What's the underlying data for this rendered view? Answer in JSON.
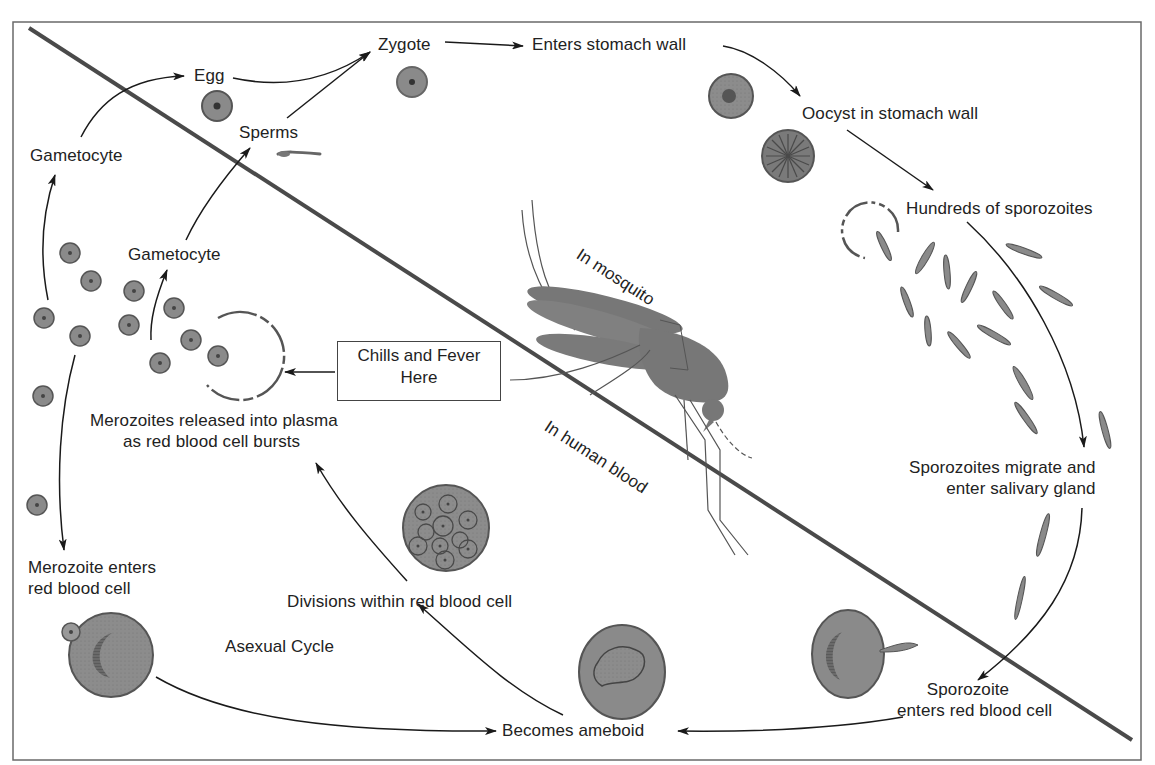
{
  "diagram": {
    "type": "life-cycle",
    "regions": {
      "upper_right": "In mosquito",
      "lower_left": "In human blood"
    },
    "colors": {
      "frame": "#6a6a6a",
      "divider": "#4a4a4a",
      "arrow": "#1a1a1a",
      "cell_fill": "#8a8a8a",
      "cell_stroke": "#555555",
      "nucleus": "#444444",
      "mosquito": "#7a7a7a"
    }
  },
  "labels": {
    "egg": "Egg",
    "zygote": "Zygote",
    "enters_stomach_wall": "Enters stomach wall",
    "oocyst": "Oocyst in stomach wall",
    "hundreds_sporozoites": "Hundreds of sporozoites",
    "sporozoites_migrate_1": "Sporozoites migrate and",
    "sporozoites_migrate_2": "enter salivary gland",
    "sporozoite_enters_1": "Sporozoite",
    "sporozoite_enters_2": "enters red blood cell",
    "becomes_ameboid": "Becomes ameboid",
    "divisions": "Divisions within red blood cell",
    "merozoites_released_1": "Merozoites released into plasma",
    "merozoites_released_2": "as red blood cell bursts",
    "merozoite_enters_1": "Merozoite enters",
    "merozoite_enters_2": "red blood cell",
    "asexual_cycle": "Asexual Cycle",
    "gametocyte_outer": "Gametocyte",
    "gametocyte_inner": "Gametocyte",
    "sperms": "Sperms",
    "in_mosquito": "In mosquito",
    "in_human_blood": "In human blood"
  },
  "callout": {
    "line1": "Chills and Fever",
    "line2": "Here"
  },
  "flow": [
    {
      "from": "Gametocyte",
      "to": "Egg"
    },
    {
      "from": "Gametocyte",
      "to": "Sperms"
    },
    {
      "from": "Egg",
      "to": "Zygote"
    },
    {
      "from": "Sperms",
      "to": "Zygote"
    },
    {
      "from": "Zygote",
      "to": "Enters stomach wall"
    },
    {
      "from": "Enters stomach wall",
      "to": "Oocyst in stomach wall"
    },
    {
      "from": "Oocyst in stomach wall",
      "to": "Hundreds of sporozoites"
    },
    {
      "from": "Hundreds of sporozoites",
      "to": "Sporozoites migrate and enter salivary gland"
    },
    {
      "from": "Sporozoites migrate and enter salivary gland",
      "to": "Sporozoite enters red blood cell"
    },
    {
      "from": "Sporozoite enters red blood cell",
      "to": "Becomes ameboid"
    },
    {
      "from": "Merozoite enters red blood cell",
      "to": "Becomes ameboid"
    },
    {
      "from": "Becomes ameboid",
      "to": "Divisions within red blood cell"
    },
    {
      "from": "Divisions within red blood cell",
      "to": "Merozoites released into plasma as red blood cell bursts"
    },
    {
      "from": "Merozoites released",
      "to": "Gametocyte"
    },
    {
      "from": "Merozoites released",
      "to": "Merozoite enters red blood cell"
    },
    {
      "from": "Chills and Fever Here",
      "to": "Burst red blood cell"
    }
  ]
}
